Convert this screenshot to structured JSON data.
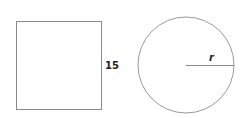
{
  "square": {
    "side_label": "15"
  },
  "circle": {
    "radius_label": "r"
  },
  "colors": {
    "stroke": "#8a8a8a",
    "text": "#222222"
  }
}
